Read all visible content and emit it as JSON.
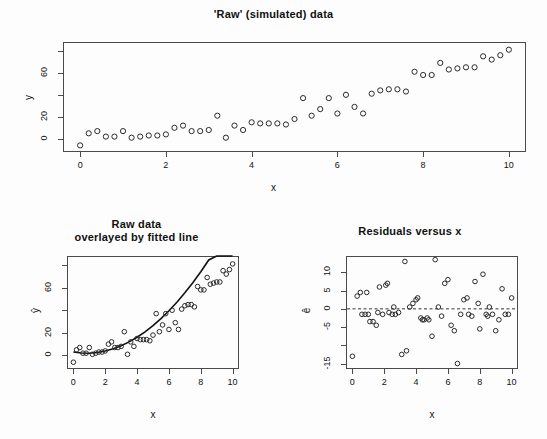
{
  "figure": {
    "background": "#fdfdfd",
    "foreground": "#1a1a1a",
    "point_color": "#2b2b2b",
    "line_color": "#111111"
  },
  "panels": {
    "top": {
      "title": "'Raw' (simulated) data",
      "xlabel": "x",
      "ylabel": "y"
    },
    "bottom_left": {
      "title_line1": "Raw data",
      "title_line2": "overlayed by fitted line",
      "xlabel": "x",
      "ylabel": "ŷ"
    },
    "bottom_right": {
      "title": "Residuals versus x",
      "xlabel": "x",
      "ylabel": "ê"
    }
  },
  "chart_data": [
    {
      "id": "raw-scatter",
      "type": "scatter",
      "title": "'Raw' (simulated) data",
      "xlabel": "x",
      "ylabel": "y",
      "xlim": [
        -0.4,
        10.4
      ],
      "ylim": [
        -12,
        88
      ],
      "xticks": [
        0,
        2,
        4,
        6,
        8,
        10
      ],
      "xticklabels": [
        "0",
        "2",
        "4",
        "6",
        "8",
        "10"
      ],
      "yticks": [
        0,
        20,
        40,
        60,
        80
      ],
      "yticklabels": [
        "0",
        "20",
        "",
        "60",
        ""
      ],
      "grid": false,
      "legend": false,
      "x": [
        0.0,
        0.2,
        0.4,
        0.6,
        0.8,
        1.0,
        1.2,
        1.4,
        1.6,
        1.8,
        2.0,
        2.2,
        2.4,
        2.6,
        2.8,
        3.0,
        3.2,
        3.4,
        3.6,
        3.8,
        4.0,
        4.2,
        4.4,
        4.6,
        4.8,
        5.0,
        5.2,
        5.4,
        5.6,
        5.8,
        6.0,
        6.2,
        6.4,
        6.6,
        6.8,
        7.0,
        7.2,
        7.4,
        7.6,
        7.8,
        8.0,
        8.2,
        8.4,
        8.6,
        8.8,
        9.0,
        9.2,
        9.4,
        9.6,
        9.8,
        10.0
      ],
      "y": [
        -6,
        5,
        7,
        2,
        2,
        7,
        1,
        2,
        3,
        3,
        4,
        10,
        12,
        7,
        7,
        8,
        21,
        1,
        12,
        8,
        15,
        14,
        14,
        14,
        13,
        18,
        37,
        21,
        27,
        37,
        23,
        40,
        29,
        23,
        41,
        44,
        45,
        45,
        43,
        61,
        58,
        58,
        69,
        63,
        64,
        65,
        65,
        75,
        72,
        76,
        81
      ]
    },
    {
      "id": "fitted-overlay",
      "type": "scatter",
      "title": "Raw data overlayed by fitted line",
      "xlabel": "x",
      "ylabel": "ŷ",
      "xlim": [
        -0.4,
        10.4
      ],
      "ylim": [
        -12,
        88
      ],
      "xticks": [
        0,
        2,
        4,
        6,
        8,
        10
      ],
      "xticklabels": [
        "0",
        "2",
        "4",
        "6",
        "8",
        "10"
      ],
      "yticks": [
        0,
        20,
        40,
        60,
        80
      ],
      "yticklabels": [
        "0",
        "20",
        "",
        "60",
        ""
      ],
      "grid": false,
      "legend": false,
      "x": [
        0.0,
        0.2,
        0.4,
        0.6,
        0.8,
        1.0,
        1.2,
        1.4,
        1.6,
        1.8,
        2.0,
        2.2,
        2.4,
        2.6,
        2.8,
        3.0,
        3.2,
        3.4,
        3.6,
        3.8,
        4.0,
        4.2,
        4.4,
        4.6,
        4.8,
        5.0,
        5.2,
        5.4,
        5.6,
        5.8,
        6.0,
        6.2,
        6.4,
        6.6,
        6.8,
        7.0,
        7.2,
        7.4,
        7.6,
        7.8,
        8.0,
        8.2,
        8.4,
        8.6,
        8.8,
        9.0,
        9.2,
        9.4,
        9.6,
        9.8,
        10.0
      ],
      "y": [
        -6,
        5,
        7,
        2,
        2,
        7,
        1,
        2,
        3,
        3,
        4,
        10,
        12,
        7,
        7,
        8,
        21,
        1,
        12,
        8,
        15,
        14,
        14,
        14,
        13,
        18,
        37,
        21,
        27,
        37,
        23,
        40,
        29,
        23,
        41,
        44,
        45,
        45,
        43,
        61,
        58,
        58,
        69,
        63,
        64,
        65,
        65,
        75,
        72,
        76,
        81
      ],
      "fit_curve": {
        "label": "fitted line",
        "form": "quadratic",
        "x": [
          0,
          0.5,
          1,
          1.5,
          2,
          2.5,
          3,
          3.5,
          4,
          4.5,
          5,
          5.5,
          6,
          6.5,
          7,
          7.5,
          8,
          8.5,
          9,
          9.5,
          10
        ],
        "y": [
          3.0,
          2.2,
          2.0,
          2.6,
          3.9,
          5.9,
          8.6,
          12.0,
          16.1,
          20.9,
          26.4,
          32.6,
          39.5,
          47.1,
          55.4,
          64.4,
          74.1,
          84.5,
          95.6,
          107.4,
          119.9
        ]
      }
    },
    {
      "id": "residuals",
      "type": "scatter",
      "title": "Residuals versus x",
      "xlabel": "x",
      "ylabel": "ê",
      "xlim": [
        -0.4,
        10.4
      ],
      "ylim": [
        -16.5,
        14.5
      ],
      "xticks": [
        0,
        2,
        4,
        6,
        8,
        10
      ],
      "xticklabels": [
        "0",
        "2",
        "4",
        "6",
        "8",
        "10"
      ],
      "yticks": [
        -15,
        -10,
        -5,
        0,
        5,
        10
      ],
      "yticklabels": [
        "-15",
        "",
        "-5",
        "0",
        "5",
        "10"
      ],
      "grid": false,
      "legend": false,
      "zero_line": 0,
      "x": [
        0.0,
        0.3,
        0.5,
        0.6,
        0.8,
        0.9,
        1.0,
        1.1,
        1.3,
        1.5,
        1.6,
        1.7,
        1.9,
        2.1,
        2.2,
        2.3,
        2.5,
        2.6,
        2.7,
        2.9,
        3.1,
        3.3,
        3.4,
        3.6,
        3.8,
        4.0,
        4.1,
        4.3,
        4.4,
        4.5,
        4.7,
        4.8,
        5.0,
        5.2,
        5.4,
        5.6,
        5.8,
        6.0,
        6.2,
        6.4,
        6.6,
        6.8,
        7.0,
        7.2,
        7.3,
        7.5,
        7.7,
        7.9,
        8.0,
        8.2,
        8.4,
        8.5,
        8.6,
        8.8,
        9.0,
        9.2,
        9.4,
        9.6,
        9.8,
        10.0
      ],
      "y": [
        -13.0,
        3.5,
        4.5,
        -1.5,
        -1.5,
        4.5,
        -1.5,
        -3.5,
        -3.5,
        -4.5,
        -1.0,
        6.0,
        -1.5,
        6.5,
        7.0,
        -1.0,
        -1.5,
        0.5,
        -1.5,
        -1.0,
        -12.5,
        13.0,
        -11.5,
        0.5,
        1.5,
        2.5,
        3.0,
        -2.5,
        -3.0,
        -3.0,
        -2.5,
        -3.0,
        -7.5,
        13.5,
        0.5,
        -2.0,
        7.0,
        8.0,
        -4.5,
        -6.0,
        -15.0,
        -1.5,
        2.5,
        3.0,
        -1.5,
        -2.0,
        7.5,
        1.5,
        -5.5,
        9.5,
        -1.5,
        -2.0,
        0.5,
        -1.5,
        -6.0,
        -3.0,
        5.5,
        -1.5,
        -1.5,
        3.0
      ]
    }
  ]
}
